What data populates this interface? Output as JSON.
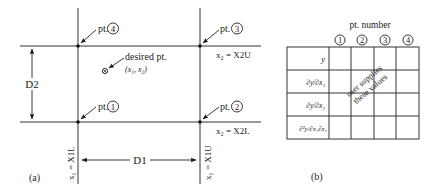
{
  "panel_a": {
    "caption": "(a)",
    "points": [
      {
        "id": "1",
        "prefix": "pt.",
        "number": "1"
      },
      {
        "id": "2",
        "prefix": "pt.",
        "number": "2"
      },
      {
        "id": "3",
        "prefix": "pt.",
        "number": "3"
      },
      {
        "id": "4",
        "prefix": "pt.",
        "number": "4"
      }
    ],
    "desired_point": {
      "label": "desired pt.",
      "coords": "(x₁, x₂)"
    },
    "upper_line_label": "x₂ = X2U",
    "lower_line_label": "x₂ = X2L",
    "left_line_label": "x₁ = X1L",
    "right_line_label": "x₁ = X1U",
    "width_dimension": "D1",
    "height_dimension": "D2"
  },
  "panel_b": {
    "caption": "(b)",
    "header": "pt. number",
    "columns": [
      "1",
      "2",
      "3",
      "4"
    ],
    "rows": [
      "y",
      "∂y/∂x₁",
      "∂y/∂x₂",
      "∂²y/∂x₁∂x₂"
    ],
    "annotation_line1": "user supplies",
    "annotation_line2": "these values"
  }
}
